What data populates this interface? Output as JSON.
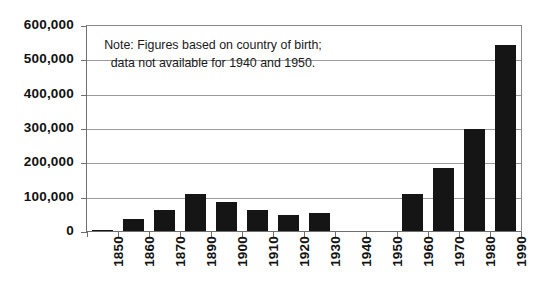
{
  "chart_data": {
    "type": "bar",
    "title": "",
    "xlabel": "",
    "ylabel": "",
    "grid": true,
    "legend": "none",
    "ylim": [
      0,
      600000
    ],
    "ytick_labels": [
      "600,000",
      "500,000",
      "400,000",
      "300,000",
      "200,000",
      "100,000",
      "0"
    ],
    "ytick_values": [
      600000,
      500000,
      400000,
      300000,
      200000,
      100000,
      0
    ],
    "categories": [
      "1850",
      "1860",
      "1870",
      "1890",
      "1900",
      "1910",
      "1920",
      "1930",
      "1940",
      "1950",
      "1960",
      "1970",
      "1980",
      "1990"
    ],
    "values": [
      3000,
      38000,
      65000,
      112000,
      88000,
      63000,
      51000,
      55000,
      null,
      null,
      110000,
      185000,
      300000,
      546000
    ],
    "missing_categories": [
      "1940",
      "1950"
    ],
    "annotations": [
      {
        "name": "note",
        "text": "Note: Figures based on country of birth; data not available for 1940 and 1950."
      }
    ]
  },
  "colors": {
    "bar": "#151515",
    "grid": "#9b9b9b",
    "axis": "#6f6f6f",
    "text": "#111111",
    "background": "#ffffff"
  }
}
